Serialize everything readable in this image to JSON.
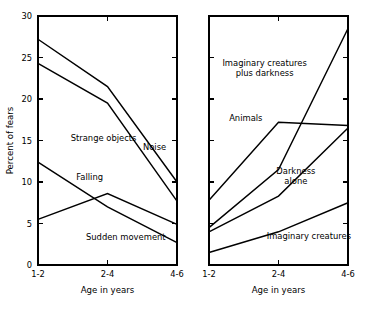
{
  "chart_data": [
    {
      "panel_id": "left",
      "type": "line",
      "title": "",
      "xlabel": "Age in years",
      "ylabel": "Percent of fears",
      "categories": [
        "1-2",
        "2-4",
        "4-6"
      ],
      "ylim": [
        0,
        30
      ],
      "yticks": [
        0,
        5,
        10,
        15,
        20,
        25,
        30
      ],
      "ytick_labels": [
        "0",
        "5",
        "10",
        "15",
        "20",
        "25",
        "30"
      ],
      "grid": false,
      "legend": "inline-labels",
      "series": [
        {
          "name": "Noise",
          "values": [
            27.2,
            21.5,
            10.0
          ]
        },
        {
          "name": "Strange objects",
          "values": [
            24.3,
            19.5,
            7.7
          ]
        },
        {
          "name": "Falling",
          "values": [
            12.4,
            7.0,
            2.7
          ]
        },
        {
          "name": "Sudden movement",
          "values": [
            5.5,
            8.6,
            4.9
          ]
        }
      ],
      "annotations": [
        {
          "text": "Noise",
          "x_frac": 0.755,
          "y_value": 13.9,
          "anchor": "start",
          "lines": [
            "Noise"
          ]
        },
        {
          "text": "Strange objects",
          "x_frac": 0.235,
          "y_value": 14.9,
          "anchor": "start",
          "lines": [
            "Strange objects"
          ]
        },
        {
          "text": "Falling",
          "x_frac": 0.275,
          "y_value": 10.3,
          "anchor": "start",
          "lines": [
            "Falling"
          ]
        },
        {
          "text": "Sudden movement",
          "x_frac": 0.345,
          "y_value": 3.0,
          "anchor": "start",
          "lines": [
            "Sudden movement"
          ]
        }
      ]
    },
    {
      "panel_id": "right",
      "type": "line",
      "title": "",
      "xlabel": "Age in years",
      "ylabel": "",
      "categories": [
        "1-2",
        "2-4",
        "4-6"
      ],
      "ylim": [
        0,
        30
      ],
      "yticks": [
        0,
        5,
        10,
        15,
        20,
        25,
        30
      ],
      "ytick_labels": [
        "",
        "",
        "",
        "",
        "",
        "",
        ""
      ],
      "grid": false,
      "legend": "inline-labels",
      "series": [
        {
          "name": "Imaginary creatures plus darkness",
          "values": [
            4.5,
            11.5,
            28.5
          ]
        },
        {
          "name": "Animals",
          "values": [
            7.8,
            17.2,
            16.8
          ]
        },
        {
          "name": "Darkness alone",
          "values": [
            4.0,
            8.3,
            16.5
          ]
        },
        {
          "name": "Imaginary creatures",
          "values": [
            1.5,
            4.0,
            7.5
          ]
        }
      ],
      "annotations": [
        {
          "text": "Imaginary creatures plus darkness",
          "x_frac": 0.4,
          "y_value": 24.0,
          "anchor": "middle",
          "lines": [
            "Imaginary creatures",
            "plus darkness"
          ]
        },
        {
          "text": "Animals",
          "x_frac": 0.145,
          "y_value": 17.4,
          "anchor": "start",
          "lines": [
            "Animals"
          ]
        },
        {
          "text": "Darkness alone",
          "x_frac": 0.625,
          "y_value": 11.0,
          "anchor": "middle",
          "lines": [
            "Darkness",
            "alone"
          ]
        },
        {
          "text": "Imaginary creatures",
          "x_frac": 0.415,
          "y_value": 3.1,
          "anchor": "start",
          "lines": [
            "Imaginary creatures"
          ]
        }
      ]
    }
  ],
  "colors": {
    "line": "#000000",
    "axis": "#000000",
    "background": "#ffffff"
  }
}
